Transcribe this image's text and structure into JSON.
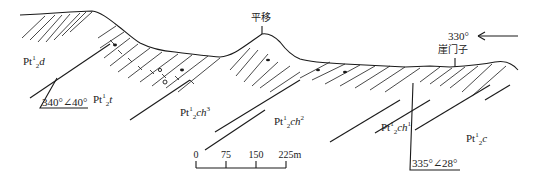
{
  "diagram": {
    "type": "geological-cross-section",
    "direction": {
      "label": "330°",
      "arrow": "left-arrow"
    },
    "place_names": [
      {
        "id": "pingyi",
        "label": "平移"
      },
      {
        "id": "yamenzi",
        "label": "崖门子"
      }
    ],
    "units": [
      {
        "id": "pt2-1-d",
        "base": "Pt",
        "sup": "1",
        "sub": "2",
        "sym": "d"
      },
      {
        "id": "pt2-1-t",
        "base": "Pt",
        "sup": "1",
        "sub": "2",
        "sym": "t"
      },
      {
        "id": "pt2-1-ch3",
        "base": "Pt",
        "sup": "1",
        "sub": "2",
        "sym": "ch",
        "sym_sup": "3"
      },
      {
        "id": "pt2-1-ch2",
        "base": "Pt",
        "sup": "1",
        "sub": "2",
        "sym": "ch",
        "sym_sup": "2"
      },
      {
        "id": "pt2-1-ch1",
        "base": "Pt",
        "sup": "1",
        "sub": "2",
        "sym": "ch",
        "sym_sup": "1"
      },
      {
        "id": "pt2-1-c",
        "base": "Pt",
        "sup": "1",
        "sub": "2",
        "sym": "c"
      }
    ],
    "attitudes": [
      {
        "id": "att-left",
        "label": "340°∠40°"
      },
      {
        "id": "att-right",
        "label": "335°∠28°"
      }
    ],
    "scale_bar": {
      "ticks": [
        "0",
        "75",
        "150",
        "225m"
      ],
      "unit": "m"
    },
    "colors": {
      "line": "#1a1a1a",
      "background": "#ffffff"
    }
  }
}
